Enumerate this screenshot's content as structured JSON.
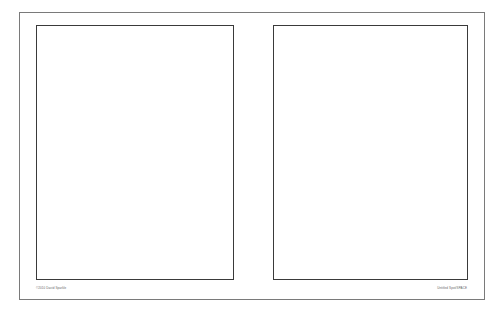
{
  "document": {
    "type": "two-page spread",
    "pages": [
      {
        "position": "left",
        "content": ""
      },
      {
        "position": "right",
        "content": ""
      }
    ],
    "footer": {
      "left": "©2010 David Sparkle",
      "right": "Untitled Spot/SPACE"
    },
    "colors": {
      "background": "#ffffff",
      "frame_border": "#7a7a7a",
      "page_border": "#3a3a3a",
      "footer_text": "#666666"
    }
  }
}
